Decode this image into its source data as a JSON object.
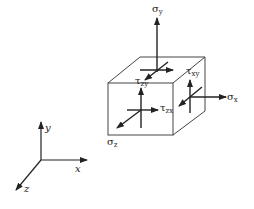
{
  "diagram": {
    "line_color": "#222222",
    "axes": {
      "x_label": "x",
      "y_label": "y",
      "z_label": "z"
    },
    "stress_labels": {
      "sigma_y": {
        "symbol": "σ",
        "sub": "y"
      },
      "sigma_x": {
        "symbol": "σ",
        "sub": "x"
      },
      "sigma_z": {
        "symbol": "σ",
        "sub": "z"
      },
      "tau_xy": {
        "symbol": "τ",
        "sub": "xy"
      },
      "tau_zx": {
        "symbol": "τ",
        "sub": "zx"
      },
      "tau_zy": {
        "symbol": "τ",
        "sub": "zy"
      }
    }
  }
}
